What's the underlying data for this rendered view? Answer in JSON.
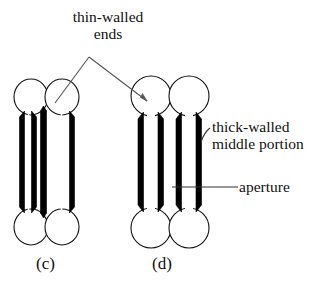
{
  "figure": {
    "background_color": "#ffffff",
    "ink_color": "#000000",
    "leader_color": "#4a4a4a",
    "annotations": [
      {
        "id": "thin-walled-ends",
        "text": "thin-walled ends",
        "line1": "thin-walled",
        "line2": "ends",
        "position": "top-center"
      },
      {
        "id": "thick-walled-middle-portion",
        "text": "thick-walled middle portion",
        "line1": "thick-walled",
        "line2": "middle portion",
        "position": "right-upper"
      },
      {
        "id": "aperture",
        "text": "aperture",
        "line1": "aperture",
        "line2": "",
        "position": "right-lower"
      }
    ],
    "panels": [
      {
        "id": "panel-c",
        "caption": "(c)",
        "cells": 2,
        "bars": 3,
        "description": "two fused cells sharing a common middle wall"
      },
      {
        "id": "panel-d",
        "caption": "(d)",
        "cells": 2,
        "bars": 4,
        "description": "two separate cells each with two thick walls and an aperture between"
      }
    ]
  }
}
